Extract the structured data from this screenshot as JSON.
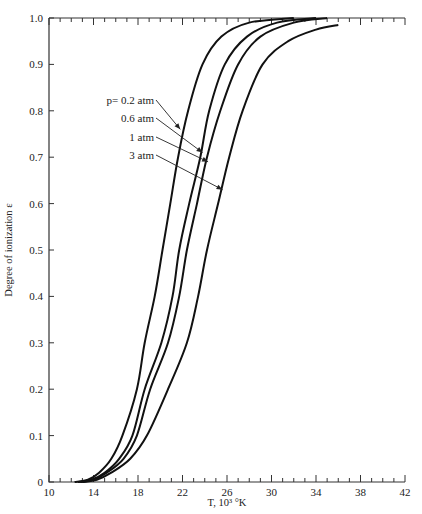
{
  "chart_data": {
    "type": "line",
    "title": "",
    "xlabel": "T, 10³ °K",
    "ylabel": "Degree of ionization ε",
    "xlim": [
      10,
      42
    ],
    "ylim": [
      0,
      1.0
    ],
    "x_ticks": [
      10,
      14,
      18,
      22,
      26,
      30,
      34,
      38,
      42
    ],
    "x_tick_labels": [
      "10",
      "14",
      "18",
      "22",
      "26",
      "30",
      "34",
      "38",
      "42"
    ],
    "x_minor_step": 1,
    "y_ticks": [
      0,
      0.1,
      0.2,
      0.3,
      0.4,
      0.5,
      0.6,
      0.7,
      0.8,
      0.9,
      1.0
    ],
    "y_tick_labels": [
      "0",
      "0.1",
      "0.2",
      "0.3",
      "0.4",
      "0.5",
      "0.6",
      "0.7",
      "0.8",
      "0.9",
      "1.0"
    ],
    "grid": false,
    "legend": "inline annotations with arrows",
    "series": [
      {
        "name": "p= 0.2 atm",
        "label": "p= 0.2 atm",
        "points": [
          [
            12.3,
            0
          ],
          [
            13.5,
            0.005
          ],
          [
            14.5,
            0.02
          ],
          [
            15.6,
            0.05
          ],
          [
            16.6,
            0.1
          ],
          [
            17.9,
            0.2
          ],
          [
            18.6,
            0.3
          ],
          [
            19.5,
            0.4
          ],
          [
            20.2,
            0.5
          ],
          [
            20.9,
            0.6
          ],
          [
            21.6,
            0.7
          ],
          [
            22.5,
            0.8
          ],
          [
            23.8,
            0.9
          ],
          [
            25.5,
            0.96
          ],
          [
            28.0,
            0.99
          ],
          [
            32.0,
            1.0
          ]
        ]
      },
      {
        "name": "0.6 atm",
        "label": "0.6 atm",
        "points": [
          [
            12.6,
            0
          ],
          [
            13.8,
            0.005
          ],
          [
            15.0,
            0.02
          ],
          [
            16.3,
            0.05
          ],
          [
            17.5,
            0.1
          ],
          [
            18.6,
            0.2
          ],
          [
            20.1,
            0.3
          ],
          [
            21.1,
            0.4
          ],
          [
            21.7,
            0.5
          ],
          [
            22.6,
            0.6
          ],
          [
            23.6,
            0.7
          ],
          [
            24.4,
            0.8
          ],
          [
            25.8,
            0.9
          ],
          [
            27.8,
            0.96
          ],
          [
            30.5,
            0.99
          ],
          [
            34.0,
            1.0
          ]
        ]
      },
      {
        "name": "1 atm",
        "label": "1 atm",
        "points": [
          [
            12.8,
            0
          ],
          [
            14.0,
            0.005
          ],
          [
            15.2,
            0.02
          ],
          [
            16.7,
            0.05
          ],
          [
            17.9,
            0.1
          ],
          [
            19.1,
            0.2
          ],
          [
            20.7,
            0.3
          ],
          [
            21.7,
            0.4
          ],
          [
            22.4,
            0.5
          ],
          [
            23.3,
            0.6
          ],
          [
            24.2,
            0.7
          ],
          [
            25.4,
            0.8
          ],
          [
            27.0,
            0.9
          ],
          [
            29.0,
            0.96
          ],
          [
            32.0,
            0.99
          ],
          [
            35.0,
            1.0
          ]
        ]
      },
      {
        "name": "3 atm",
        "label": "3 atm",
        "points": [
          [
            13.0,
            0
          ],
          [
            14.3,
            0.005
          ],
          [
            15.6,
            0.02
          ],
          [
            17.3,
            0.05
          ],
          [
            18.8,
            0.1
          ],
          [
            20.7,
            0.2
          ],
          [
            22.4,
            0.3
          ],
          [
            23.4,
            0.4
          ],
          [
            24.2,
            0.5
          ],
          [
            25.2,
            0.6
          ],
          [
            26.2,
            0.7
          ],
          [
            27.4,
            0.8
          ],
          [
            29.2,
            0.9
          ],
          [
            31.5,
            0.95
          ],
          [
            34.0,
            0.975
          ],
          [
            36.0,
            0.985
          ]
        ]
      }
    ],
    "annotations": [
      {
        "text": "p= 0.2 atm",
        "series": "p= 0.2 atm",
        "arrow_to": [
          21.8,
          0.76
        ]
      },
      {
        "text": "0.6 atm",
        "series": "0.6 atm",
        "arrow_to": [
          23.8,
          0.71
        ]
      },
      {
        "text": "1 atm",
        "series": "1 atm",
        "arrow_to": [
          24.3,
          0.69
        ]
      },
      {
        "text": "3 atm",
        "series": "3 atm",
        "arrow_to": [
          25.6,
          0.63
        ]
      }
    ]
  }
}
